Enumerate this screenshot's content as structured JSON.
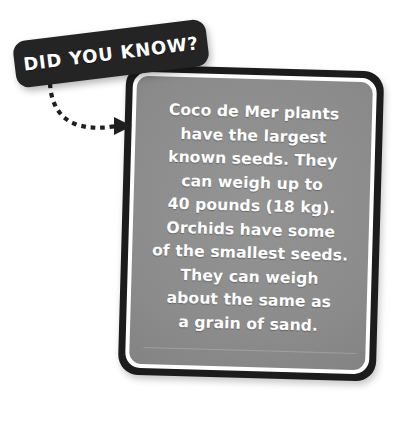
{
  "background_color": "#ffffff",
  "banner": {
    "label": "DID YOU KNOW?",
    "background_color": "#242424",
    "text_color": "#ffffff"
  },
  "connector": {
    "style_name": "dotted-curve-arrow",
    "arrow_name": "arrow-head-icon",
    "color": "#1f1f1f"
  },
  "card": {
    "border_color": "#1c1c1c",
    "inner_ring_color": "#ffffff",
    "fill_color": "#8a8a8a",
    "text_color": "#ffffff",
    "body_lines": [
      "Coco de Mer plants",
      "have the largest",
      "known seeds. They",
      "can weigh up to",
      "40 pounds (18 kg).",
      "Orchids have some",
      "of the smallest seeds.",
      "They can weigh",
      "about the same as",
      "a grain of sand."
    ],
    "body_text": "Coco de Mer plants have the largest known seeds. They can weigh up to 40 pounds (18 kg). Orchids have some of the smallest seeds. They can weigh about the same as a grain of sand."
  }
}
